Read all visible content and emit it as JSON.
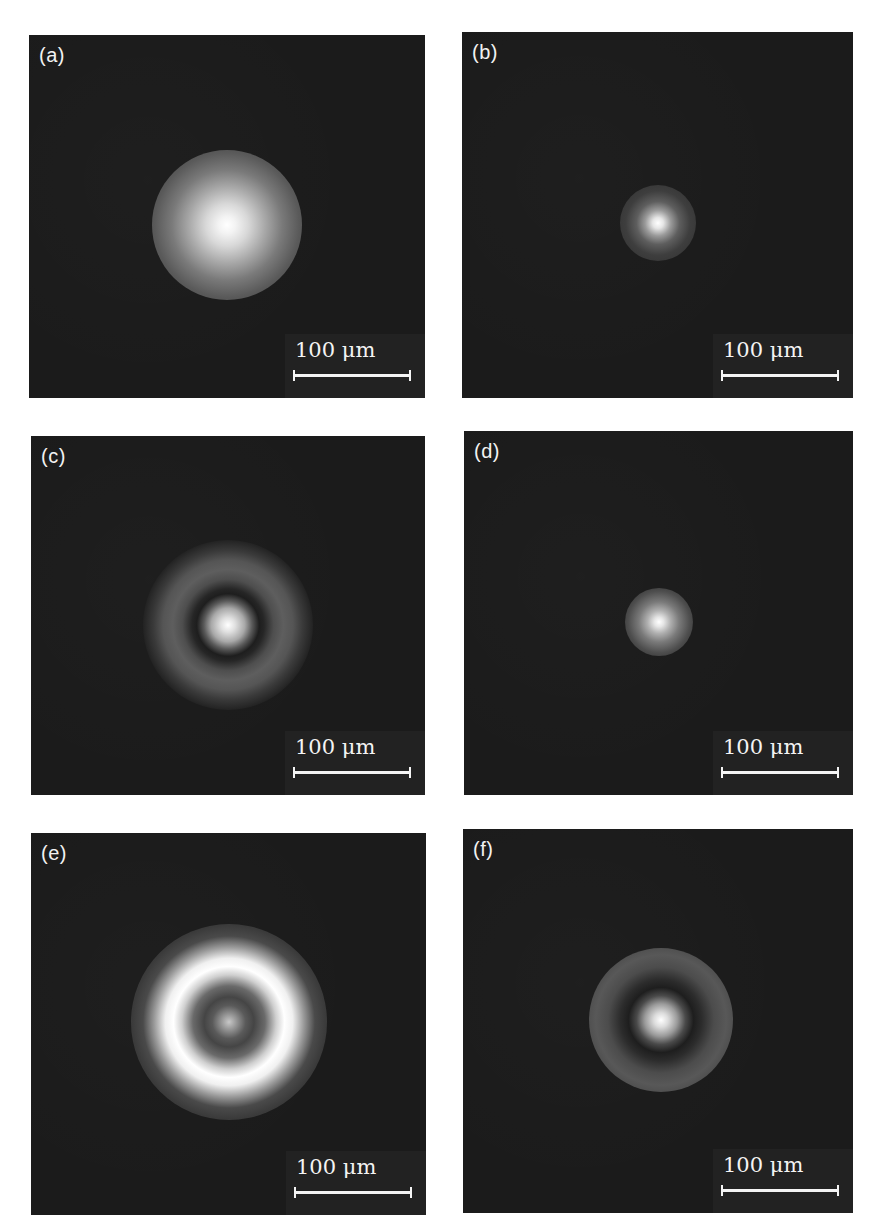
{
  "figure": {
    "background_color": "#ffffff",
    "panel_background_color": "#1b1b1b",
    "panels": [
      {
        "id": "a",
        "label": "(a)",
        "scale_bar": {
          "text": "100 μm",
          "length_um": 100
        },
        "pattern": "single broad bright spot with soft halo"
      },
      {
        "id": "b",
        "label": "(b)",
        "scale_bar": {
          "text": "100 μm",
          "length_um": 100
        },
        "pattern": "small bright spot with faint halo"
      },
      {
        "id": "c",
        "label": "(c)",
        "scale_bar": {
          "text": "100 μm",
          "length_um": 100
        },
        "pattern": "bright central spot, dark ring, grey ring, faint outer ring"
      },
      {
        "id": "d",
        "label": "(d)",
        "scale_bar": {
          "text": "100 μm",
          "length_um": 100
        },
        "pattern": "small soft bright spot"
      },
      {
        "id": "e",
        "label": "(e)",
        "scale_bar": {
          "text": "100 μm",
          "length_um": 100
        },
        "pattern": "dim central spot inside bright ring, faint outer rings"
      },
      {
        "id": "f",
        "label": "(f)",
        "scale_bar": {
          "text": "100 μm",
          "length_um": 100
        },
        "pattern": "bright central spot, dark ring, grey outer ring"
      }
    ]
  }
}
